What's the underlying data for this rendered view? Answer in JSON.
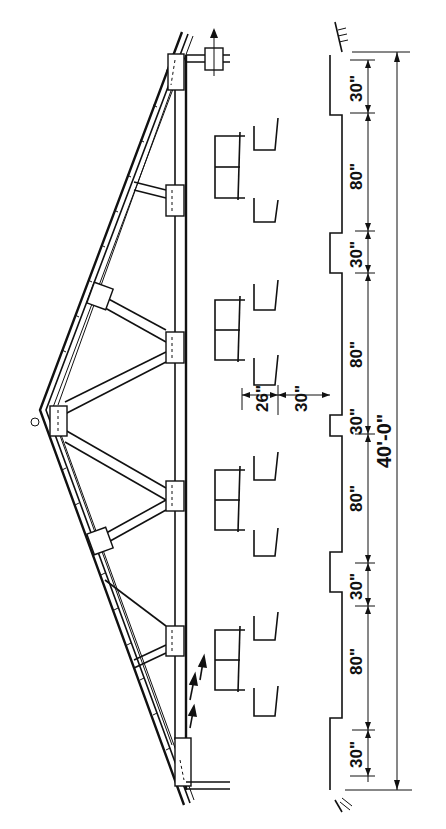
{
  "drawing": {
    "subject": "Building cross-section with roof truss and stall layout (rotated 90°)",
    "orientation": "rotated-90-ccw",
    "colors": {
      "line": "#111111",
      "background": "#ffffff"
    }
  },
  "dimensions": {
    "overall": "40'-0\"",
    "segments": [
      "30\"",
      "80\"",
      "30\"",
      "80\"",
      "30\"",
      "80\"",
      "30\"",
      "80\"",
      "30\""
    ],
    "stall_detail": {
      "stall_depth": "26\"",
      "alley_width": "30\""
    }
  }
}
